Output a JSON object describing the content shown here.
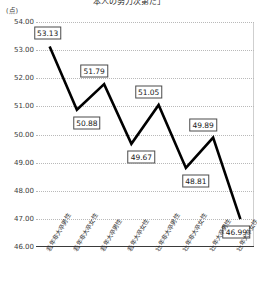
{
  "chart_data": {
    "type": "line",
    "title": "本人の努力次第だ」",
    "unit_label": "(点)",
    "ylabel": "",
    "xlabel": "",
    "ylim": [
      46.0,
      54.0
    ],
    "grid": true,
    "legend": "none",
    "yticks": [
      "54.00",
      "53.00",
      "52.00",
      "51.00",
      "50.00",
      "49.00",
      "48.00",
      "47.00",
      "46.00"
    ],
    "ytick_values": [
      54.0,
      53.0,
      52.0,
      51.0,
      50.0,
      49.0,
      48.0,
      47.0,
      46.0
    ],
    "categories": [
      "若年非大卒男性",
      "若年非大卒女性",
      "若年大卒男性",
      "若年大卒女性",
      "壮年非大卒男性",
      "壮年非大卒女性",
      "壮年大卒男性",
      "壮年大卒女性"
    ],
    "values": [
      53.13,
      50.88,
      51.79,
      49.67,
      51.05,
      48.81,
      49.89,
      46.99
    ],
    "data_labels": [
      "53.13",
      "50.88",
      "51.79",
      "49.67",
      "51.05",
      "48.81",
      "49.89",
      "46.99"
    ],
    "series": [
      {
        "name": "本人の努力次第だ",
        "values": [
          53.13,
          50.88,
          51.79,
          49.67,
          51.05,
          48.81,
          49.89,
          46.99
        ]
      }
    ],
    "line_color": "#000000",
    "grid_color": "#b9b9b9",
    "axis_color": "#3a3a3a"
  }
}
